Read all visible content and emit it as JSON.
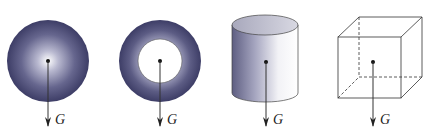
{
  "figure": {
    "shapes": [
      {
        "name": "solid-sphere",
        "label": "G"
      },
      {
        "name": "ring",
        "label": "G"
      },
      {
        "name": "cylinder",
        "label": "G"
      },
      {
        "name": "cube",
        "label": "G"
      }
    ]
  },
  "colors": {
    "body": "#3f3f68",
    "highlight": "#ffffff",
    "line": "#333333"
  }
}
